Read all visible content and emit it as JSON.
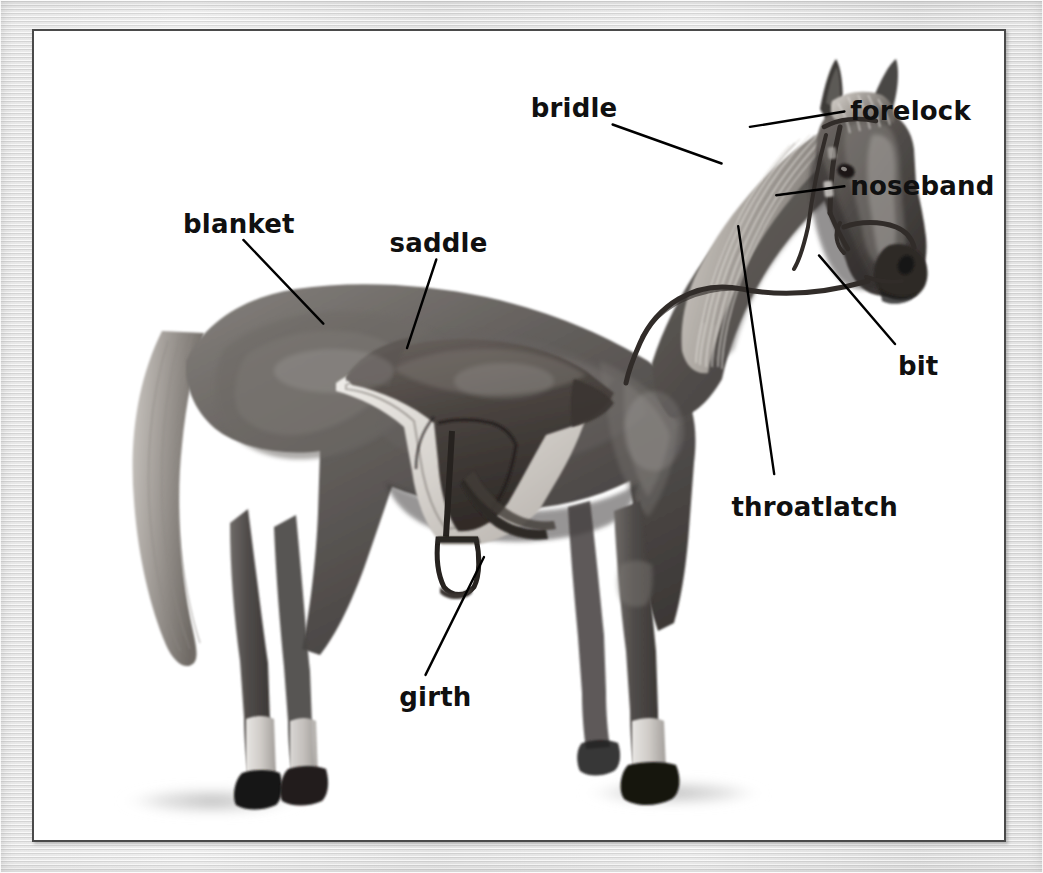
{
  "diagram": {
    "style": "grayscale pencil illustration with leader-line callouts",
    "frame": {
      "outer_color": "#e4e4e4",
      "panel_color": "#ffffff",
      "panel_border_color": "#4a4a4a"
    },
    "label_color": "#101010",
    "leader_color": "#000000",
    "labels": [
      {
        "id": "bridle",
        "text": "bridle",
        "x": 0.51,
        "y": 0.079,
        "anchor": "start",
        "leader": [
          [
            0.594,
            0.115
          ],
          [
            0.706,
            0.163
          ]
        ]
      },
      {
        "id": "forelock",
        "text": "forelock",
        "x": 0.838,
        "y": 0.082,
        "anchor": "start",
        "leader": [
          [
            0.832,
            0.099
          ],
          [
            0.735,
            0.118
          ]
        ]
      },
      {
        "id": "noseband",
        "text": "noseband",
        "x": 0.838,
        "y": 0.175,
        "anchor": "start",
        "leader": [
          [
            0.832,
            0.191
          ],
          [
            0.762,
            0.202
          ]
        ]
      },
      {
        "id": "bit",
        "text": "bit",
        "x": 0.887,
        "y": 0.396,
        "anchor": "start",
        "leader": [
          [
            0.884,
            0.385
          ],
          [
            0.806,
            0.276
          ]
        ]
      },
      {
        "id": "throatlatch",
        "text": "throatlatch",
        "x": 0.716,
        "y": 0.57,
        "anchor": "start",
        "leader": [
          [
            0.76,
            0.545
          ],
          [
            0.723,
            0.24
          ]
        ]
      },
      {
        "id": "blanket",
        "text": "blanket",
        "x": 0.153,
        "y": 0.221,
        "anchor": "start",
        "leader": [
          [
            0.215,
            0.257
          ],
          [
            0.297,
            0.36
          ]
        ]
      },
      {
        "id": "saddle",
        "text": "saddle",
        "x": 0.365,
        "y": 0.245,
        "anchor": "start",
        "leader": [
          [
            0.413,
            0.281
          ],
          [
            0.383,
            0.39
          ]
        ]
      },
      {
        "id": "girth",
        "text": "girth",
        "x": 0.375,
        "y": 0.803,
        "anchor": "start",
        "leader": [
          [
            0.402,
            0.792
          ],
          [
            0.462,
            0.647
          ]
        ]
      }
    ]
  }
}
